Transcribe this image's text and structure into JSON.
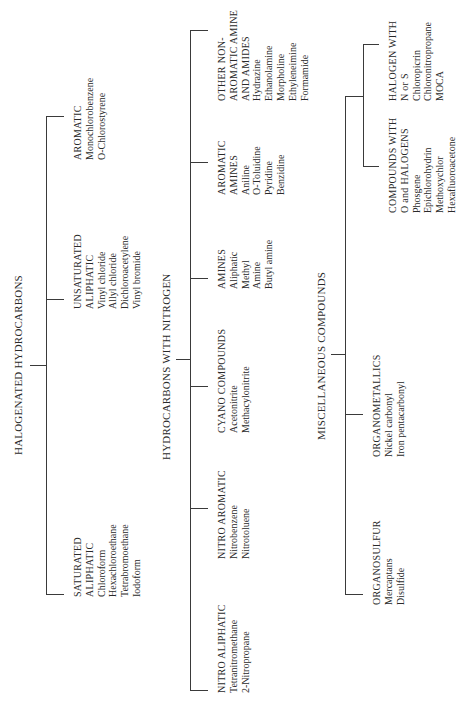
{
  "diagram_title": "Classification of hazardous organic compounds",
  "sections": [
    {
      "title": "HALOGENATED HYDROCARBONS",
      "groups": [
        {
          "heading": [
            "SATURATED",
            "ALIPHATIC"
          ],
          "items": [
            "Chloroform",
            "Hexachloroethane",
            "Tetrabromoethane",
            "Iodoform"
          ]
        },
        {
          "heading": [
            "UNSATURATED",
            "ALIPHATIC"
          ],
          "items": [
            "Vinyl chloride",
            "Allyl chloride",
            "Dichloroacetylene",
            "Vinyl bromide"
          ]
        },
        {
          "heading": [
            "AROMATIC"
          ],
          "items": [
            "Monochlorobenzene",
            "O-Chlorostyrene"
          ]
        }
      ]
    },
    {
      "title": "HYDROCARBONS WITH NITROGEN",
      "groups": [
        {
          "heading": [
            "NITRO ALIPHATIC"
          ],
          "items": [
            "Tetranitromethane",
            "2-Nitropropane"
          ]
        },
        {
          "heading": [
            "NITRO AROMATIC"
          ],
          "items": [
            "Nitrobenzene",
            "Nitrotoluene"
          ]
        },
        {
          "heading": [
            "CYANO COMPOUNDS"
          ],
          "items": [
            "Acetonitrite",
            "Methacylonitrite"
          ]
        },
        {
          "heading": [
            "AMINES"
          ],
          "items": [
            "Aliphatic",
            "Methyl",
            "Amine",
            "Butyl amine"
          ]
        },
        {
          "heading": [
            "AROMATIC",
            "AMINES"
          ],
          "items": [
            "Aniline",
            "O-Toluidine",
            "Pyridine",
            "Benzidine"
          ]
        },
        {
          "heading": [
            "OTHER NON-",
            "AROMATIC AMINE",
            "AND AMIDES"
          ],
          "items": [
            "Hydrazine",
            "Ethanolamine",
            "Morpholine",
            "Ethyleneimine",
            "Formamide"
          ]
        }
      ]
    },
    {
      "title": "MISCELLANEOUS COMPOUNDS",
      "groups": [
        {
          "heading": [
            "ORGANOSULFUR"
          ],
          "items": [
            "Mercaptans",
            "Disulfide"
          ]
        },
        {
          "heading": [
            "ORGANOMETALLICS"
          ],
          "items": [
            "Nickel carbonyl",
            "Iron pentacarbonyl"
          ]
        },
        {
          "heading": [
            "COMPOUNDS WITH",
            "O and HALOGENS"
          ],
          "items": [
            "Phosgene",
            "Epichlorohydrin",
            "Methoxychlor",
            "Hexafluoroacetone"
          ]
        },
        {
          "heading": [
            "HALOGEN WITH",
            "N or S"
          ],
          "items": [
            "Chloropicrin",
            "Chloronitropropane",
            "MOCA"
          ]
        }
      ]
    }
  ],
  "colors": {
    "background": "#ffffff",
    "ink": "#2a2a2a",
    "lines": "#3a3a3a"
  }
}
